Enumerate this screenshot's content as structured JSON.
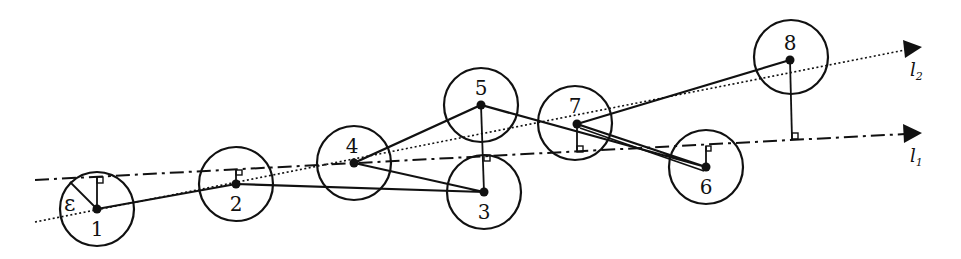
{
  "diagram": {
    "type": "geometric-trajectory-simplification",
    "colors": {
      "ink": "#111111",
      "background": "#ffffff"
    },
    "tolerance_label": "ε",
    "circle_radius": 37,
    "points": [
      {
        "id": "1",
        "label": "1",
        "x": 97,
        "y": 209,
        "label_pos": "below"
      },
      {
        "id": "2",
        "label": "2",
        "x": 236,
        "y": 184,
        "label_pos": "below"
      },
      {
        "id": "3",
        "label": "3",
        "x": 484,
        "y": 192,
        "label_pos": "below"
      },
      {
        "id": "4",
        "label": "4",
        "x": 354,
        "y": 163,
        "label_pos": "above"
      },
      {
        "id": "5",
        "label": "5",
        "x": 481,
        "y": 105,
        "label_pos": "above"
      },
      {
        "id": "6",
        "label": "6",
        "x": 706,
        "y": 167,
        "label_pos": "below"
      },
      {
        "id": "7",
        "label": "7",
        "x": 577,
        "y": 124,
        "label_pos": "above"
      },
      {
        "id": "8",
        "label": "8",
        "x": 790,
        "y": 60,
        "label_pos": "above"
      }
    ],
    "path_order": [
      "1",
      "2",
      "3",
      "4",
      "5",
      "6",
      "7",
      "8"
    ],
    "lines": [
      {
        "id": "l1",
        "name": "l",
        "subscript": "1",
        "style": "dash-dot",
        "from": [
          35,
          180
        ],
        "to": [
          905,
          134
        ]
      },
      {
        "id": "l2",
        "name": "l",
        "subscript": "2",
        "style": "dotted",
        "from": [
          35,
          222
        ],
        "to": [
          905,
          50
        ]
      }
    ],
    "perpendiculars": [
      {
        "from_point": "1",
        "to_line": "l1"
      },
      {
        "from_point": "2",
        "to_line": "l1"
      },
      {
        "from_point": "5",
        "to_line": "l1"
      },
      {
        "from_point": "3",
        "to_line": "l1"
      },
      {
        "from_point": "7",
        "to_line": "l1"
      },
      {
        "from_point": "6",
        "to_line": "l1"
      },
      {
        "from_point": "8",
        "to_line": "l1"
      }
    ]
  }
}
